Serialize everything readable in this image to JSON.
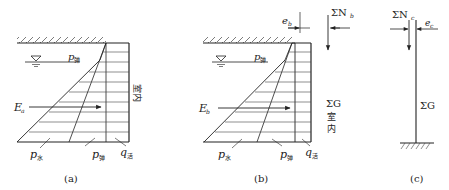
{
  "figures": [
    {
      "id": "a",
      "caption": "(a)",
      "labels": {
        "p_upper": "p",
        "p_upper_sub": "弹",
        "E": "E",
        "E_sub": "a",
        "p_water": "p",
        "p_water_sub": "水",
        "p_soil": "p",
        "p_soil_sub": "弹",
        "q": "q",
        "q_sub": "活",
        "side_text": "室内"
      }
    },
    {
      "id": "b",
      "caption": "(b)",
      "labels": {
        "p_upper": "p",
        "p_upper_sub": "弹",
        "E": "E",
        "E_sub": "b",
        "p_water": "p",
        "p_water_sub": "水",
        "p_soil": "p",
        "p_soil_sub": "弹",
        "q": "q",
        "q_sub": "活",
        "e": "e",
        "e_sub": "b",
        "N": "ΣN",
        "N_sub": "b",
        "G": "ΣG",
        "side_text_1": "室",
        "side_text_2": "内"
      }
    },
    {
      "id": "c",
      "caption": "(c)",
      "labels": {
        "N": "ΣN",
        "N_sub": "c",
        "e": "e",
        "e_sub": "c",
        "G": "ΣG"
      }
    }
  ],
  "colors": {
    "line": "#222222",
    "background": "#ffffff"
  }
}
